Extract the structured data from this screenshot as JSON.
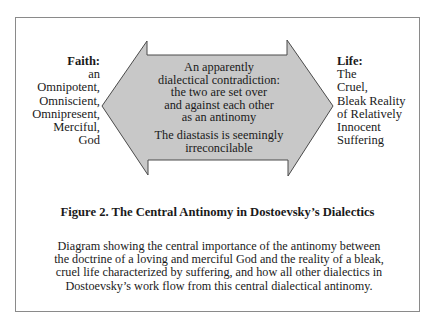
{
  "figure": {
    "left_label": {
      "heading": "Faith:",
      "lines": [
        "an",
        "Omnipotent,",
        "Omniscient,",
        "Omnipresent,",
        "Merciful,",
        "God"
      ]
    },
    "right_label": {
      "heading": "Life:",
      "lines": [
        "The",
        "Cruel,",
        "Bleak Reality",
        "of Relatively",
        "Innocent",
        "Suffering"
      ]
    },
    "center": {
      "paragraph1": [
        "An apparently",
        "dialectical contradiction:",
        "the two are set over",
        "and against each other",
        "as an antinomy"
      ],
      "paragraph2": [
        "The diastasis is seemingly",
        "irreconcilable"
      ]
    },
    "arrow": {
      "type": "double-headed horizontal arrow",
      "fill": "#c8c8c8",
      "stroke": "#4a4a4a"
    },
    "caption": {
      "title": "Figure 2. The Central Antinomy in Dostoevsky’s Dialectics",
      "description_lines": [
        "Diagram showing the central importance of the antinomy between",
        "the doctrine of a loving and merciful God and the reality of a bleak,",
        "cruel life characterized by suffering, and how all other dialectics in",
        "Dostoevsky’s work flow from this central dialectical antinomy."
      ]
    },
    "colors": {
      "frame_border": "#8a8a8a",
      "text": "#1a1a1a",
      "background": "#ffffff"
    }
  }
}
